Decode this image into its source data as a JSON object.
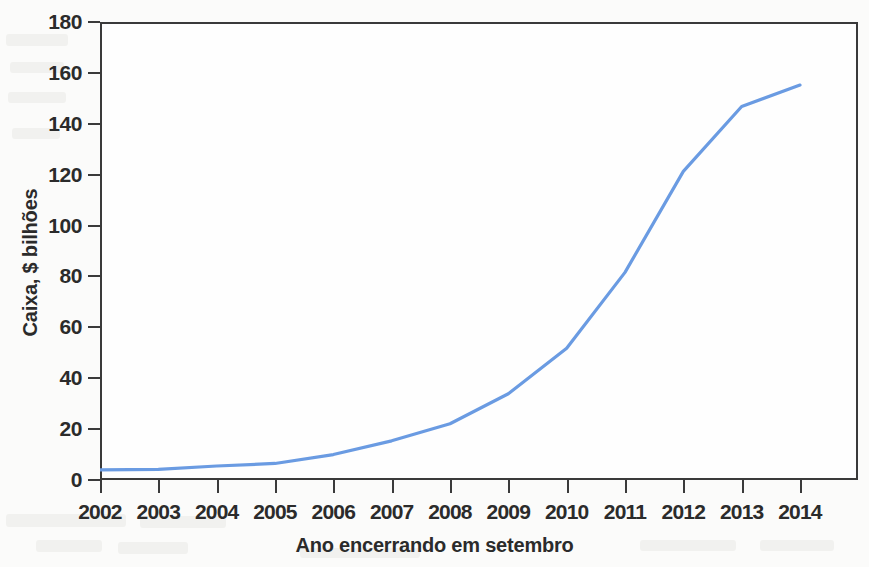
{
  "chart_data": {
    "type": "line",
    "title": "",
    "xlabel": "Ano encerrando em setembro",
    "ylabel": "Caixa, $ bilhões",
    "x": [
      2002,
      2003,
      2004,
      2005,
      2006,
      2007,
      2008,
      2009,
      2010,
      2011,
      2012,
      2013,
      2014
    ],
    "xtick_labels": [
      "2002",
      "2003",
      "2004",
      "2005",
      "2006",
      "2007",
      "2008",
      "2009",
      "2010",
      "2011",
      "2012",
      "2013",
      "2014"
    ],
    "ytick_labels": [
      "0",
      "20",
      "40",
      "60",
      "80",
      "100",
      "120",
      "140",
      "160",
      "180"
    ],
    "yticks": [
      0,
      20,
      40,
      60,
      80,
      100,
      120,
      140,
      160,
      180
    ],
    "ylim": [
      0,
      180
    ],
    "xlim": [
      2002,
      2014
    ],
    "grid": false,
    "legend": false,
    "series": [
      {
        "name": "Caixa",
        "color": "#6a9be2",
        "values": [
          4.0,
          4.2,
          5.5,
          6.5,
          10.0,
          15.4,
          22.1,
          33.9,
          51.8,
          81.6,
          121.3,
          146.8,
          155.2
        ]
      }
    ],
    "line_color": "#6a9be2",
    "axis_color": "#3a3a3a",
    "background_color": "#fbfbfa"
  }
}
